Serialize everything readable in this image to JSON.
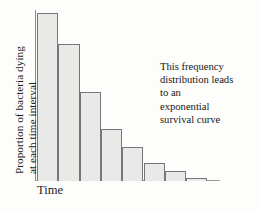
{
  "figure": {
    "background_color": "#fdfdfc",
    "axis_color": "#8a8a88"
  },
  "axes": {
    "y_label_line1": "Proportion of bacteria dying",
    "y_label_line2": "at each time interval",
    "x_label": "Time"
  },
  "annotation": {
    "lines": [
      "This frequency",
      "distribution leads",
      "to an",
      "exponential",
      "survival curve"
    ]
  },
  "chart_data": {
    "type": "bar",
    "title": "",
    "xlabel": "Time",
    "ylabel": "Proportion of bacteria dying at each time interval",
    "categories": [
      "1",
      "2",
      "3",
      "4",
      "5",
      "6",
      "7",
      "8"
    ],
    "values": [
      100,
      82,
      53,
      31,
      20,
      11,
      6,
      2
    ],
    "ylim": [
      0,
      108
    ],
    "grid": false,
    "legend": null,
    "bar_fill_color": "#e9e9e7",
    "bar_edge_color": "#77777a",
    "annotations": [
      "This frequency distribution leads to an exponential survival curve"
    ]
  }
}
